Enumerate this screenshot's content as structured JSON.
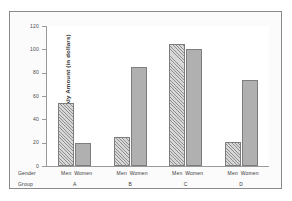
{
  "scan": {
    "top_strip_text": ""
  },
  "axis": {
    "y_title": "Average Weekly Amount (in dollars)",
    "y_ticks": [
      "0",
      "20",
      "40",
      "60",
      "80",
      "100",
      "120"
    ],
    "row_key_gender": "Gender",
    "row_key_group": "Group"
  },
  "colors": {
    "men_bar": "#b2b2b2",
    "women_bar": "#b0b0b0",
    "bar_outline": "#7d7d7d",
    "axis": "#9a9a9a",
    "frame": "#8a8a8a",
    "text": "#3a3a3a",
    "plot_background": "#ffffff",
    "figure_background": "#fbfbfb"
  },
  "chart_data": {
    "type": "bar",
    "title": "",
    "xlabel": "Group",
    "ylabel": "Average Weekly Amount (in dollars)",
    "ylim": [
      0,
      120
    ],
    "ytick_step": 20,
    "grid": false,
    "legend": "none",
    "categories": [
      "A",
      "B",
      "C",
      "D"
    ],
    "series": [
      {
        "name": "Men",
        "values": [
          54,
          25,
          105,
          21
        ],
        "fill": "diagonal-hatch"
      },
      {
        "name": "Women",
        "values": [
          20,
          85,
          100,
          74
        ],
        "fill": "solid-gray"
      }
    ],
    "gender_labels": [
      "Men",
      "Women"
    ],
    "groups": [
      {
        "label": "A",
        "men": 54,
        "women": 20
      },
      {
        "label": "B",
        "men": 25,
        "women": 85
      },
      {
        "label": "C",
        "men": 105,
        "women": 100
      },
      {
        "label": "D",
        "men": 21,
        "women": 74
      }
    ]
  }
}
